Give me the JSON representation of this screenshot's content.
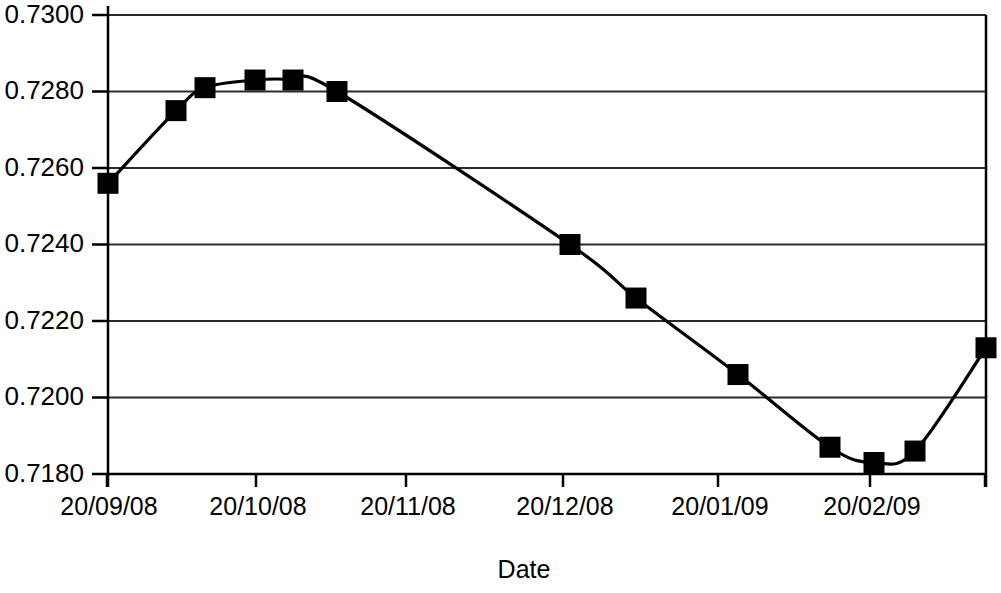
{
  "chart_data": {
    "type": "line",
    "title": "",
    "subtitle": "",
    "xlabel": "Date",
    "ylabel": "",
    "grid": true,
    "legend": false,
    "marker_style": "filled-square",
    "line_color": "#000000",
    "marker_color": "#000000",
    "background_color": "#ffffff",
    "x": [
      "20/09/08",
      "06/10/08",
      "13/10/08",
      "24/10/08",
      "03/11/08",
      "13/11/08",
      "09/12/08",
      "24/12/08",
      "07/01/09",
      "28/01/09",
      "08/02/09",
      "18/02/09",
      "03/03/09"
    ],
    "values": [
      0.7256,
      0.7275,
      0.7281,
      0.7283,
      0.7283,
      0.728,
      0.724,
      0.7226,
      0.7206,
      0.7187,
      0.7183,
      0.7186,
      0.7213
    ],
    "x_positions_px": [
      108,
      176,
      205,
      255,
      293,
      337,
      570,
      636,
      738,
      830,
      874,
      915,
      986
    ],
    "ylim": [
      0.718,
      0.73
    ],
    "ytick_labels": [
      "0.7300",
      "0.7280",
      "0.7260",
      "0.7240",
      "0.7220",
      "0.7200",
      "0.7180"
    ],
    "ytick_values": [
      0.73,
      0.728,
      0.726,
      0.724,
      0.722,
      0.72,
      0.718
    ],
    "xtick_labels": [
      "20/09/08",
      "20/10/08",
      "20/11/08",
      "20/12/08",
      "20/01/09",
      "20/02/09"
    ],
    "xtick_positions_px": [
      107,
      256,
      406,
      563,
      718,
      870
    ],
    "extra_xtick_positions_px": [
      985
    ]
  },
  "axes": {
    "x_title": "Date"
  }
}
